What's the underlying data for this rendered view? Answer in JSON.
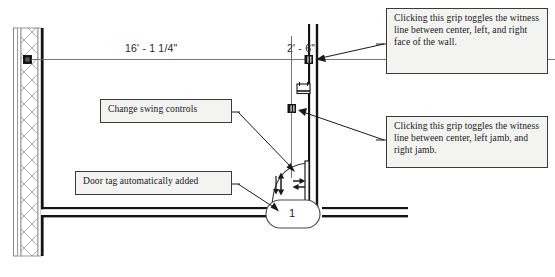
{
  "diagram": {
    "dimensions": [
      {
        "name": "wall-to-door-dimension",
        "value": "16' - 1 1/4\""
      },
      {
        "name": "door-width-dimension",
        "value": "2' - 6\""
      }
    ],
    "door_tag": {
      "value": "1"
    },
    "callouts": [
      {
        "id": "change-swing-controls",
        "text": "Change swing controls"
      },
      {
        "id": "door-tag-automatically-added",
        "text": "Door tag automatically added"
      },
      {
        "id": "wall-witness-grip",
        "text": "Clicking this grip toggles the witness line between center, left, and right face of the wall."
      },
      {
        "id": "jamb-witness-grip",
        "text": "Clicking this grip toggles the witness line between center, left jamb, and right jamb."
      }
    ],
    "icons": {
      "flip_vertical": "flip-vertical-arrow-icon",
      "flip_horizontal": "flip-horizontal-arrow-icon",
      "witness_line_toggle": "witness-line-toggle-icon",
      "wall_grip": "wall-witness-grip-icon",
      "jamb_grip": "jamb-witness-grip-icon"
    },
    "colors": {
      "line": "#1a1a1a",
      "hatch": "#8c8c8c",
      "dimension": "#555555",
      "callout_fill": "#f3f3f1",
      "callout_border": "#3a3a3a",
      "background": "#ffffff"
    }
  }
}
